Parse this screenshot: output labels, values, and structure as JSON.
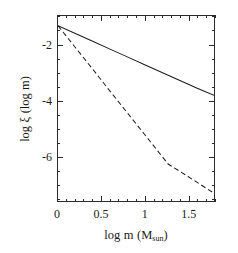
{
  "chart_data": {
    "type": "line",
    "title": "",
    "xlabel": "log m (M_sun)",
    "ylabel": "log xi (log m)",
    "xlim": [
      0.0,
      1.8
    ],
    "ylim": [
      -7.6,
      -0.95
    ],
    "grid": false,
    "legend_position": "none",
    "x_ticks_major": [
      0,
      0.5,
      1,
      1.5
    ],
    "x_tick_labels": [
      "0",
      "0.5",
      "1",
      "1.5"
    ],
    "x_minor_per_major": 5,
    "y_ticks_major": [
      -2,
      -4,
      -6
    ],
    "y_tick_labels": [
      "-2",
      "-4",
      "-6"
    ],
    "y_minor_per_major": 4,
    "series": [
      {
        "name": "solid",
        "style": "solid",
        "color": "#1a1a1a",
        "x": [
          0.0,
          0.2,
          0.4,
          0.6,
          0.8,
          1.0,
          1.2,
          1.4,
          1.6,
          1.8
        ],
        "y": [
          -1.3,
          -1.58,
          -1.86,
          -2.14,
          -2.42,
          -2.7,
          -2.98,
          -3.26,
          -3.54,
          -3.8
        ]
      },
      {
        "name": "dashed",
        "style": "dashed",
        "color": "#1a1a1a",
        "x": [
          0.0,
          0.2,
          0.4,
          0.6,
          0.8,
          1.0,
          1.27,
          1.5,
          1.8
        ],
        "y": [
          -1.3,
          -2.08,
          -2.86,
          -3.65,
          -4.43,
          -5.21,
          -6.27,
          -6.72,
          -7.32
        ]
      }
    ]
  },
  "axis": {
    "x_title_parts": {
      "lead": "log",
      "var": "m",
      "open": "(M",
      "sub": "sun",
      "close": ")"
    },
    "y_title_parts": {
      "lead": "log",
      "var": "ξ",
      "paren": "(log m)"
    }
  }
}
